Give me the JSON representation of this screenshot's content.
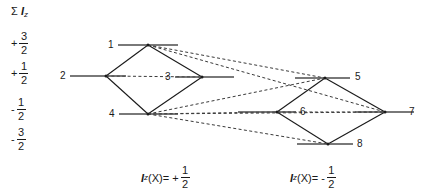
{
  "axis": {
    "title_sigma": "Σ",
    "title_var": "I",
    "title_sub": "z",
    "ticks": [
      {
        "sign": "+",
        "num": "3",
        "den": "2",
        "value": 1.5,
        "y": 42
      },
      {
        "sign": "+",
        "num": "1",
        "den": "2",
        "value": 0.5,
        "y": 72
      },
      {
        "sign": "-",
        "num": "1",
        "den": "2",
        "value": -0.5,
        "y": 108
      },
      {
        "sign": "-",
        "num": "3",
        "den": "2",
        "value": -1.5,
        "y": 138
      }
    ]
  },
  "captions": [
    {
      "id": "caption-left",
      "var": "I",
      "sub": "z",
      "arg": "(X)=",
      "sign": "+",
      "num": "1",
      "den": "2",
      "text": "Iz(X)= + 1/2"
    },
    {
      "id": "caption-right",
      "var": "I",
      "sub": "z",
      "arg": "(X)=",
      "sign": "-",
      "num": "1",
      "den": "2",
      "text": "Iz(X)= - 1/2"
    }
  ],
  "diagram": {
    "colors": {
      "line": "#1a1a1a",
      "level": "#4d4d4d",
      "dashed": "#3a3a3a",
      "background": "#ffffff"
    },
    "nodes": [
      {
        "id": 1,
        "label": "1",
        "x": 148,
        "y": 45,
        "level": "+3/2",
        "label_x": 108,
        "label_y": 39,
        "level_x1": 118,
        "level_x2": 178
      },
      {
        "id": 2,
        "label": "2",
        "x": 106,
        "y": 76,
        "level": "+1/2",
        "label_x": 60,
        "label_y": 70,
        "level_x1": 70,
        "level_x2": 126
      },
      {
        "id": 3,
        "label": "3",
        "x": 202,
        "y": 77,
        "level": "+1/2",
        "label_x": 165,
        "label_y": 71,
        "level_x1": 175,
        "level_x2": 234
      },
      {
        "id": 4,
        "label": "4",
        "x": 148,
        "y": 114,
        "level": "-1/2",
        "label_x": 109,
        "label_y": 108,
        "level_x1": 119,
        "level_x2": 178
      },
      {
        "id": 5,
        "label": "5",
        "x": 325,
        "y": 78,
        "level": "+1/2",
        "label_x": 355,
        "label_y": 71,
        "level_x1": 295,
        "level_x2": 350
      },
      {
        "id": 6,
        "label": "6",
        "x": 277,
        "y": 112,
        "level": "-1/2",
        "label_x": 300,
        "label_y": 106,
        "level_x1": 238,
        "level_x2": 296
      },
      {
        "id": 7,
        "label": "7",
        "x": 385,
        "y": 112,
        "level": "-1/2",
        "label_x": 409,
        "label_y": 106,
        "level_x1": 355,
        "level_x2": 414
      },
      {
        "id": 8,
        "label": "8",
        "x": 328,
        "y": 144,
        "level": "-3/2",
        "label_x": 357,
        "label_y": 138,
        "level_x1": 297,
        "level_x2": 353
      }
    ],
    "solid_edges": [
      {
        "from": 2,
        "to": 1
      },
      {
        "from": 1,
        "to": 3
      },
      {
        "from": 2,
        "to": 4
      },
      {
        "from": 4,
        "to": 3
      },
      {
        "from": 6,
        "to": 5
      },
      {
        "from": 5,
        "to": 7
      },
      {
        "from": 6,
        "to": 8
      },
      {
        "from": 8,
        "to": 7
      }
    ],
    "dashed_edges": [
      {
        "from": 1,
        "to": 5
      },
      {
        "from": 1,
        "to": 7
      },
      {
        "from": 2,
        "to": 3
      },
      {
        "from": 4,
        "to": 5
      },
      {
        "from": 4,
        "to": 7
      },
      {
        "from": 4,
        "to": 6
      },
      {
        "from": 4,
        "to": 8
      },
      {
        "from": 6,
        "to": 7
      }
    ]
  }
}
